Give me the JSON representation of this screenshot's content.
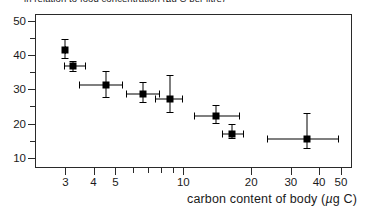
{
  "figure": {
    "top_caption": "in relation to food concentration (µg C per litre)",
    "xaxis_title_prefix": "carbon content of body (",
    "xaxis_title_italic": "µ",
    "xaxis_title_suffix": "g C)"
  },
  "chart_data": {
    "type": "scatter",
    "title": "",
    "xlabel": "carbon content of body (µg C)",
    "ylabel": "",
    "xscale": "log",
    "yscale": "linear",
    "xlim": [
      2.2,
      56
    ],
    "ylim": [
      7.0,
      52.0
    ],
    "grid": false,
    "legend": null,
    "marker": "filled-square",
    "marker_color": "#000000",
    "error_bars": "both",
    "xticks": [
      3,
      4,
      5,
      10,
      20,
      30,
      40,
      50
    ],
    "xtick_labels": [
      "3",
      "4",
      "5",
      "10",
      "20",
      "30",
      "40",
      "50"
    ],
    "xminor_ticks": [
      6,
      7,
      8,
      9
    ],
    "yticks": [
      10,
      20,
      30,
      40,
      50
    ],
    "ytick_labels": [
      "10",
      "20",
      "30",
      "40",
      "50"
    ],
    "yminor_ticks": [
      15,
      25,
      35,
      45
    ],
    "points": [
      {
        "x": 3.0,
        "y": 41.5,
        "xerr_low": 3.0,
        "xerr_high": 3.0,
        "yerr_low": 39.2,
        "yerr_high": 44.8
      },
      {
        "x": 3.25,
        "y": 36.8,
        "xerr_low": 2.95,
        "xerr_high": 3.65,
        "yerr_low": 35.4,
        "yerr_high": 38.2
      },
      {
        "x": 4.55,
        "y": 31.2,
        "xerr_low": 3.45,
        "xerr_high": 5.35,
        "yerr_low": 27.8,
        "yerr_high": 35.2
      },
      {
        "x": 6.6,
        "y": 28.5,
        "xerr_low": 5.55,
        "xerr_high": 7.8,
        "yerr_low": 26.4,
        "yerr_high": 32.0
      },
      {
        "x": 8.7,
        "y": 27.1,
        "xerr_low": 7.5,
        "xerr_high": 9.9,
        "yerr_low": 23.4,
        "yerr_high": 34.2
      },
      {
        "x": 14.0,
        "y": 22.2,
        "xerr_low": 11.2,
        "xerr_high": 17.6,
        "yerr_low": 20.2,
        "yerr_high": 25.4
      },
      {
        "x": 16.5,
        "y": 17.0,
        "xerr_low": 14.8,
        "xerr_high": 18.4,
        "yerr_low": 15.9,
        "yerr_high": 19.9
      },
      {
        "x": 35.5,
        "y": 15.4,
        "xerr_low": 23.5,
        "xerr_high": 48.5,
        "yerr_low": 12.7,
        "yerr_high": 23.0
      }
    ]
  }
}
